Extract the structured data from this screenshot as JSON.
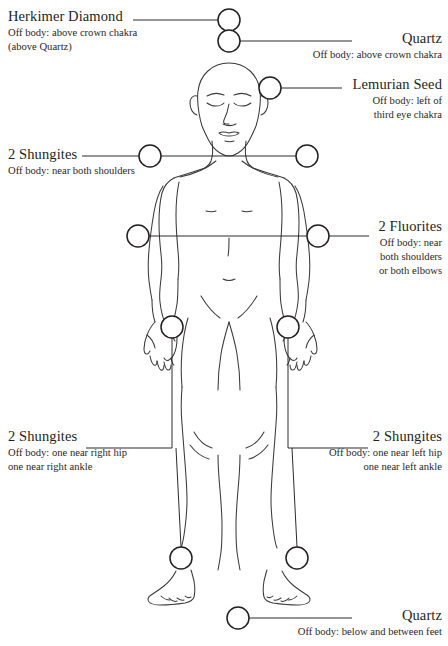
{
  "diagram": {
    "figure": "front-facing nude male human body outline, arms at sides",
    "colors": {
      "ink": "#231f20",
      "outline": "#3a3a3c",
      "background": "#ffffff"
    }
  },
  "labels": [
    {
      "id": "herkimer-diamond",
      "title": "Herkimer Diamond",
      "sub_lines": [
        "Off body: above crown chakra",
        "(above Quartz)"
      ],
      "align": "left",
      "marker": "circle-marker-crown-upper"
    },
    {
      "id": "quartz-top",
      "title": "Quartz",
      "sub_lines": [
        "Off body: above crown chakra"
      ],
      "align": "right",
      "marker": "circle-marker-crown-lower"
    },
    {
      "id": "lemurian-seed",
      "title": "Lemurian Seed",
      "sub_lines": [
        "Off body: left of",
        "third eye chakra"
      ],
      "align": "right",
      "marker": "circle-marker-third-eye"
    },
    {
      "id": "shungites-shoulders",
      "title": "2 Shungites",
      "sub_lines": [
        "Off body: near both shoulders"
      ],
      "align": "left",
      "marker": "circle-marker-shoulder-left"
    },
    {
      "id": "fluorites",
      "title": "2 Fluorites",
      "sub_lines": [
        "Off body: near",
        "both shoulders",
        "or both elbows"
      ],
      "align": "right",
      "marker": "circle-marker-elbow-right"
    },
    {
      "id": "shungites-right-side",
      "title": "2 Shungites",
      "sub_lines": [
        "Off body: one near right hip",
        "one near right ankle"
      ],
      "align": "left",
      "marker": "circle-marker-hip-left"
    },
    {
      "id": "shungites-left-side",
      "title": "2 Shungites",
      "sub_lines": [
        "Off body: one near left hip",
        "one near left ankle"
      ],
      "align": "right",
      "marker": "circle-marker-hip-right"
    },
    {
      "id": "quartz-bottom",
      "title": "Quartz",
      "sub_lines": [
        "Off body: below and between feet"
      ],
      "align": "right",
      "marker": "circle-marker-below-feet"
    }
  ],
  "markers": [
    {
      "id": "crown-upper",
      "cx": 229,
      "cy": 20,
      "r": 11
    },
    {
      "id": "crown-lower",
      "cx": 229,
      "cy": 41,
      "r": 11
    },
    {
      "id": "third-eye",
      "cx": 270,
      "cy": 88,
      "r": 11
    },
    {
      "id": "shoulder-left",
      "cx": 150,
      "cy": 156,
      "r": 11
    },
    {
      "id": "shoulder-right",
      "cx": 307,
      "cy": 156,
      "r": 11
    },
    {
      "id": "elbow-left",
      "cx": 138,
      "cy": 236,
      "r": 11
    },
    {
      "id": "elbow-right",
      "cx": 318,
      "cy": 236,
      "r": 11
    },
    {
      "id": "hip-left",
      "cx": 172,
      "cy": 327,
      "r": 11
    },
    {
      "id": "hip-right",
      "cx": 288,
      "cy": 327,
      "r": 11
    },
    {
      "id": "ankle-left",
      "cx": 181,
      "cy": 558,
      "r": 11
    },
    {
      "id": "ankle-right",
      "cx": 297,
      "cy": 558,
      "r": 11
    },
    {
      "id": "below-feet",
      "cx": 238,
      "cy": 618,
      "r": 11
    }
  ]
}
